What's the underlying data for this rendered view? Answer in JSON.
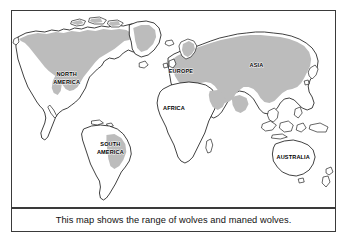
{
  "figure": {
    "type": "thematic-world-map",
    "caption": "This map shows the range of wolves and maned wolves.",
    "frame_color": "#3a3a3a",
    "background_color": "#ffffff"
  },
  "legend_semantics": {
    "range_fill_color": "#bcbcbc",
    "range_meaning": "range of wolves and maned wolves",
    "no_range_fill_color": "#ffffff",
    "coastline_color": "#000000"
  },
  "labels": [
    {
      "id": "north-america",
      "text_line1": "NORTH",
      "text_line2": "AMERICA"
    },
    {
      "id": "south-america",
      "text_line1": "SOUTH",
      "text_line2": "AMERICA"
    },
    {
      "id": "europe",
      "text_line1": "EUROPE",
      "text_line2": ""
    },
    {
      "id": "africa",
      "text_line1": "AFRICA",
      "text_line2": ""
    },
    {
      "id": "asia",
      "text_line1": "ASIA",
      "text_line2": ""
    },
    {
      "id": "australia",
      "text_line1": "AUSTRALIA",
      "text_line2": ""
    }
  ],
  "shaded_regions": [
    "Alaska",
    "Canada",
    "Greenland",
    "Northern United States",
    "Rocky Mountains",
    "Scandinavia",
    "Europe",
    "Russia",
    "Central Asia",
    "Arabian Peninsula",
    "Northern India",
    "China",
    "Mongolia",
    "Central Brazil"
  ],
  "unshaded_regions": [
    "Southern United States",
    "Mexico",
    "Central America",
    "Northern South America",
    "Southern South America",
    "Africa",
    "Southeast Asia",
    "Indonesia",
    "Australia",
    "New Zealand",
    "Japan"
  ]
}
